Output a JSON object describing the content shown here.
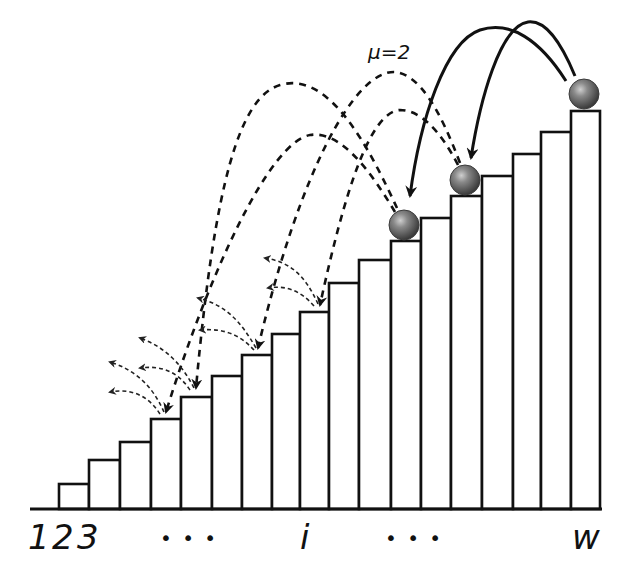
{
  "diagram": {
    "annotation": "μ=2",
    "axis_labels": [
      {
        "text": "1",
        "x": 28
      },
      {
        "text": "2",
        "x": 52
      },
      {
        "text": "3",
        "x": 77
      },
      {
        "text": "• • •",
        "x": 160
      },
      {
        "text": "i",
        "x": 300
      },
      {
        "text": "• • •",
        "x": 385
      },
      {
        "text": "w",
        "x": 572
      }
    ],
    "baseline": {
      "x1": 30,
      "x2": 602,
      "y": 509
    },
    "bars": [
      {
        "x": 59,
        "w": 30,
        "top": 484
      },
      {
        "x": 89,
        "w": 31,
        "top": 460
      },
      {
        "x": 120,
        "w": 31,
        "top": 442
      },
      {
        "x": 151,
        "w": 30,
        "top": 419
      },
      {
        "x": 181,
        "w": 31,
        "top": 397
      },
      {
        "x": 212,
        "w": 30,
        "top": 376
      },
      {
        "x": 242,
        "w": 30,
        "top": 355
      },
      {
        "x": 272,
        "w": 28,
        "top": 334
      },
      {
        "x": 300,
        "w": 29,
        "top": 312
      },
      {
        "x": 329,
        "w": 30,
        "top": 283
      },
      {
        "x": 359,
        "w": 32,
        "top": 260
      },
      {
        "x": 391,
        "w": 30,
        "top": 241
      },
      {
        "x": 421,
        "w": 30,
        "top": 218
      },
      {
        "x": 451,
        "w": 31,
        "top": 196
      },
      {
        "x": 482,
        "w": 31,
        "top": 176
      },
      {
        "x": 513,
        "w": 28,
        "top": 154
      },
      {
        "x": 541,
        "w": 30,
        "top": 132
      },
      {
        "x": 571,
        "w": 29,
        "top": 111
      }
    ],
    "balls": [
      {
        "cx": 404,
        "cy": 225,
        "r": 15
      },
      {
        "cx": 465,
        "cy": 180,
        "r": 15
      },
      {
        "cx": 584,
        "cy": 94,
        "r": 15
      }
    ],
    "colors": {
      "ball": "#7a7a7a",
      "ball_dark": "#3c3c3c",
      "ball_highlight": "#d8d8d8",
      "stroke": "#111111"
    }
  }
}
